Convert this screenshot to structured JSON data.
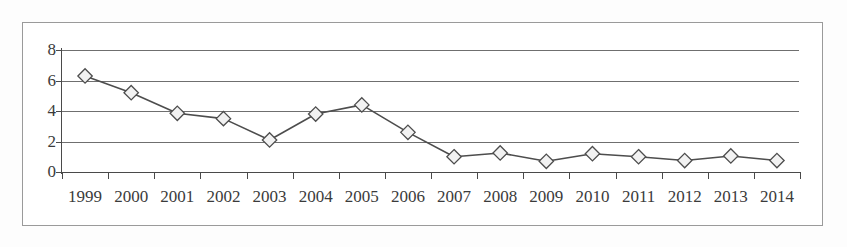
{
  "chart_data": {
    "type": "line",
    "title": "",
    "subtitle": "",
    "xlabel": "",
    "ylabel": "",
    "categories": [
      "1999",
      "2000",
      "2001",
      "2002",
      "2003",
      "2004",
      "2005",
      "2006",
      "2007",
      "2008",
      "2009",
      "2010",
      "2011",
      "2012",
      "2013",
      "2014"
    ],
    "values": [
      6.3,
      5.2,
      3.85,
      3.5,
      2.1,
      3.8,
      4.4,
      2.6,
      1.0,
      1.25,
      0.7,
      1.2,
      1.0,
      0.75,
      1.05,
      0.75
    ],
    "series": [
      {
        "name": "",
        "values": [
          6.3,
          5.2,
          3.85,
          3.5,
          2.1,
          3.8,
          4.4,
          2.6,
          1.0,
          1.25,
          0.7,
          1.2,
          1.0,
          0.75,
          1.05,
          0.75
        ]
      }
    ],
    "y_ticks": [
      0,
      2,
      4,
      6,
      8
    ],
    "ylim": [
      0,
      8
    ],
    "grid": "horizontal",
    "legend": "none",
    "marker": "diamond",
    "line_color": "#4d4d4d",
    "marker_fill": "#f2f2f2",
    "marker_stroke": "#4d4d4d",
    "gridline_color": "#6f6f6f",
    "axis_color": "#4a4a4a",
    "plot_background": "#ffffff",
    "frame_border_color": "#9a9a9a"
  }
}
